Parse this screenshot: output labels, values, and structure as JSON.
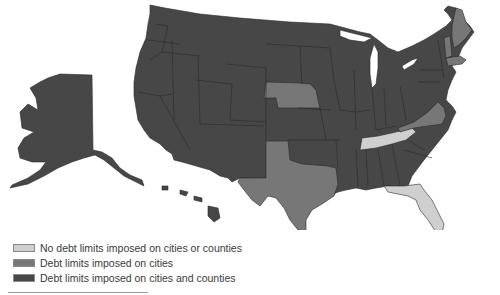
{
  "map": {
    "title": "State debt limits imposed on local governments",
    "colors": {
      "none": "#cfcfcf",
      "cities": "#777777",
      "cities_and_counties": "#474747"
    },
    "states": {
      "no_limits": [
        "Tennessee",
        "Florida"
      ],
      "cities_only": [
        "Nebraska",
        "Texas",
        "Virginia",
        "Maine",
        "Vermont",
        "Massachusetts"
      ],
      "cities_and_counties": "all other states including Alaska and Hawaii"
    }
  },
  "legend": {
    "items": [
      {
        "label": "No debt limits imposed on cities or counties",
        "color": "#cfcfcf"
      },
      {
        "label": "Debt limits imposed on cities",
        "color": "#777777"
      },
      {
        "label": "Debt limits imposed on cities and counties",
        "color": "#474747"
      }
    ]
  }
}
